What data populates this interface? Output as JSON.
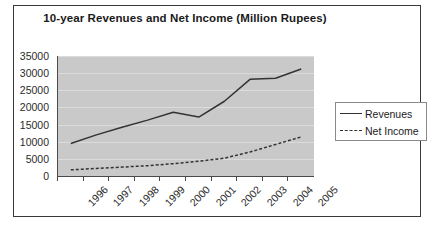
{
  "chart_data": {
    "type": "line",
    "title": "10-year Revenues and Net Income (Million Rupees)",
    "xlabel": "",
    "ylabel": "",
    "categories": [
      "1996",
      "1997",
      "1998",
      "1999",
      "2000",
      "2001",
      "2002",
      "2003",
      "2004",
      "2005"
    ],
    "ylim": [
      0,
      35000
    ],
    "yticks": [
      0,
      5000,
      10000,
      15000,
      20000,
      25000,
      30000,
      35000
    ],
    "ytick_labels": [
      "0",
      "5000",
      "10000",
      "15000",
      "20000",
      "25000",
      "30000",
      "35000"
    ],
    "grid": true,
    "legend_position": "right",
    "plot_background": "#c9c9c9",
    "line_color": "#333333",
    "series": [
      {
        "name": "Revenues",
        "style": "solid",
        "values": [
          9500,
          12000,
          14200,
          16300,
          18600,
          17200,
          21800,
          28200,
          28500,
          31200
        ]
      },
      {
        "name": "Net Income",
        "style": "dashed",
        "values": [
          1800,
          2200,
          2600,
          3000,
          3600,
          4300,
          5200,
          7000,
          9200,
          11400
        ]
      }
    ]
  },
  "legend": {
    "items": [
      {
        "label": "Revenues",
        "style": "solid"
      },
      {
        "label": "Net Income",
        "style": "dashed"
      }
    ]
  }
}
